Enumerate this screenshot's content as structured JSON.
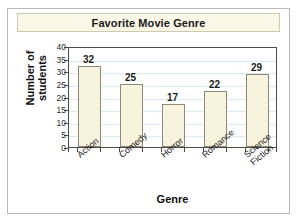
{
  "chart_data": {
    "type": "bar",
    "title": "Favorite Movie Genre",
    "xlabel": "Genre",
    "ylabel_lines": [
      "Number of",
      "students"
    ],
    "ylabel": "Number of students",
    "categories": [
      "Action",
      "Comedy",
      "Horror",
      "Romance",
      "Science Fiction"
    ],
    "category_lines": [
      [
        "Action"
      ],
      [
        "Comedy"
      ],
      [
        "Horror"
      ],
      [
        "Romance"
      ],
      [
        "Science",
        "Fiction"
      ]
    ],
    "values": [
      32,
      25,
      17,
      22,
      29
    ],
    "value_labels": [
      "32",
      "25",
      "17",
      "22",
      "29"
    ],
    "ylim": [
      0,
      40
    ],
    "ytick_values": [
      40,
      35,
      30,
      25,
      20,
      15,
      10,
      5,
      0
    ],
    "ytick_labels": [
      "40",
      "35",
      "30",
      "25",
      "20",
      "15",
      "10",
      "5",
      "0"
    ],
    "grid": true,
    "grid_axis": "y",
    "legend": "none",
    "colors": {
      "bar_fill": "#f8f3dc",
      "bar_border": "#8d8a7c",
      "gridline": "#d8ecf2",
      "axis": "#4c4a44",
      "title_banner": "#faf7e6",
      "banner_border": "#cfc9ae",
      "frame_border": "#b9b9b9",
      "text": "#1c1c1c",
      "background": "#ffffff"
    }
  }
}
